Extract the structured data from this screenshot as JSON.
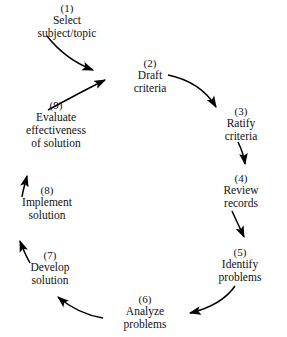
{
  "diagram": {
    "shape": "cycle",
    "direction": "clockwise",
    "background_color": "#ffffff",
    "text_color": "#111111",
    "arrow_color": "#000000",
    "nodes": [
      {
        "step": "(1)",
        "lines": [
          "Select",
          "subject/topic"
        ]
      },
      {
        "step": "(2)",
        "lines": [
          "Draft",
          "criteria"
        ]
      },
      {
        "step": "(3)",
        "lines": [
          "Ratify",
          "criteria"
        ]
      },
      {
        "step": "(4)",
        "lines": [
          "Review",
          "records"
        ]
      },
      {
        "step": "(5)",
        "lines": [
          "Identify",
          "problems"
        ]
      },
      {
        "step": "(6)",
        "lines": [
          "Analyze",
          "problems"
        ]
      },
      {
        "step": "(7)",
        "lines": [
          "Develop",
          "solution"
        ]
      },
      {
        "step": "(8)",
        "lines": [
          "Implement",
          "solution"
        ]
      },
      {
        "step": "(9)",
        "lines": [
          "Evaluate",
          "effectiveness",
          "of solution"
        ]
      }
    ],
    "connections": [
      {
        "from": "(1)",
        "to": "(2)",
        "style": "curved"
      },
      {
        "from": "(2)",
        "to": "(3)",
        "style": "curved"
      },
      {
        "from": "(3)",
        "to": "(4)",
        "style": "curved"
      },
      {
        "from": "(4)",
        "to": "(5)",
        "style": "straight"
      },
      {
        "from": "(5)",
        "to": "(6)",
        "style": "curved"
      },
      {
        "from": "(6)",
        "to": "(7)",
        "style": "curved"
      },
      {
        "from": "(7)",
        "to": "(8)",
        "style": "straight"
      },
      {
        "from": "(8)",
        "to": "(9)",
        "style": "straight"
      },
      {
        "from": "(9)",
        "to": "(2)",
        "style": "curved"
      }
    ]
  }
}
